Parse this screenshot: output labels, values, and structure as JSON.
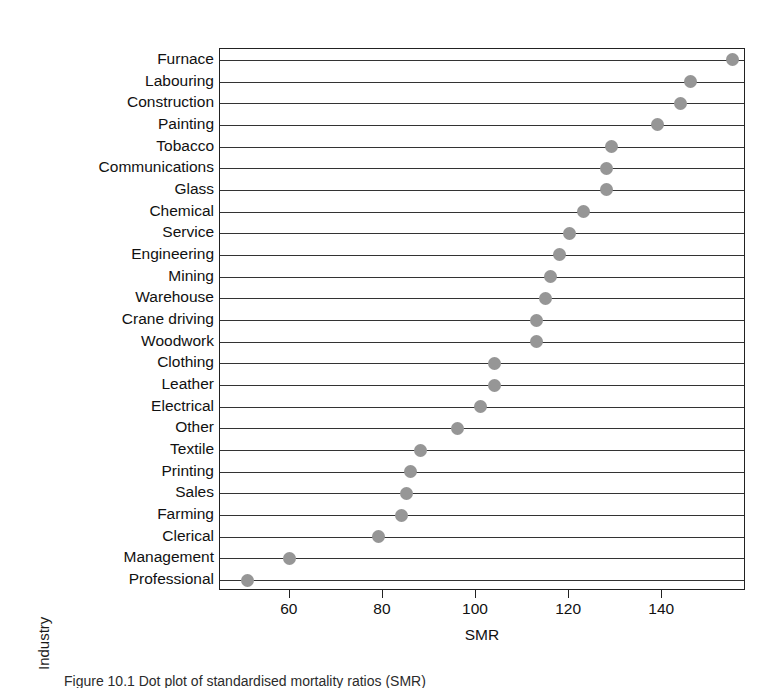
{
  "figure": {
    "axis_titles": {
      "y": "Industry",
      "x": "SMR"
    },
    "caption": "Figure 10.1  Dot plot of standardised mortality ratios (SMR)"
  },
  "colors": {
    "dot": "#969696",
    "axis": "#222222",
    "gridline": "#333333",
    "background": "#ffffff",
    "text": "#111111"
  },
  "chart_data": {
    "type": "scatter",
    "subtype": "cleveland-dot-plot",
    "title": "",
    "xlabel": "SMR",
    "ylabel": "Industry",
    "xlim": [
      45,
      158
    ],
    "ylim": null,
    "grid": "horizontal-row-rules",
    "legend": "none",
    "xticks": [
      60,
      80,
      100,
      120,
      140
    ],
    "xticklabels": [
      "60",
      "80",
      "100",
      "120",
      "140"
    ],
    "categories": [
      "Furnace",
      "Labouring",
      "Construction",
      "Painting",
      "Tobacco",
      "Communications",
      "Glass",
      "Chemical",
      "Service",
      "Engineering",
      "Mining",
      "Warehouse",
      "Crane driving",
      "Woodwork",
      "Clothing",
      "Leather",
      "Electrical",
      "Other",
      "Textile",
      "Printing",
      "Sales",
      "Farming",
      "Clerical",
      "Management",
      "Professional"
    ],
    "values": [
      155,
      146,
      144,
      139,
      129,
      128,
      128,
      123,
      120,
      118,
      116,
      115,
      113,
      113,
      104,
      104,
      101,
      96,
      88,
      86,
      85,
      84,
      79,
      60,
      51
    ]
  }
}
